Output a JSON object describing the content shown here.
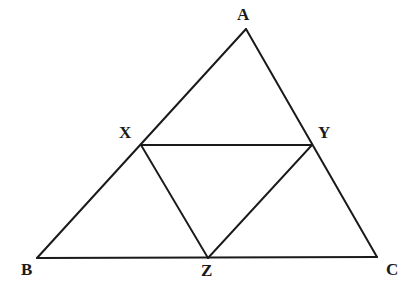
{
  "figure": {
    "canvas": {
      "width": 409,
      "height": 293
    },
    "background_color": "#ffffff",
    "stroke_color": "#1a1a1a",
    "outer_stroke_width": 2.0,
    "inner_stroke_width": 1.9,
    "points": {
      "A": {
        "label": "A",
        "x": 246,
        "y": 29,
        "label_x": 237,
        "label_y": 6
      },
      "B": {
        "label": "B",
        "x": 37,
        "y": 258,
        "label_x": 21,
        "label_y": 261
      },
      "C": {
        "label": "C",
        "x": 377,
        "y": 257,
        "label_x": 386,
        "label_y": 261
      },
      "X": {
        "label": "X",
        "x": 141,
        "y": 145,
        "label_x": 119,
        "label_y": 124
      },
      "Y": {
        "label": "Y",
        "x": 312,
        "y": 145,
        "label_x": 318,
        "label_y": 124
      },
      "Z": {
        "label": "Z",
        "x": 208,
        "y": 258,
        "label_x": 201,
        "label_y": 262
      }
    },
    "segments": [
      {
        "name": "side-AB",
        "from": "A",
        "to": "B",
        "kind": "outer"
      },
      {
        "name": "side-AC",
        "from": "A",
        "to": "C",
        "kind": "outer"
      },
      {
        "name": "side-BC",
        "from": "B",
        "to": "C",
        "kind": "outer"
      },
      {
        "name": "segment-XY",
        "from": "X",
        "to": "Y",
        "kind": "inner"
      },
      {
        "name": "segment-XZ",
        "from": "X",
        "to": "Z",
        "kind": "inner"
      },
      {
        "name": "segment-YZ",
        "from": "Y",
        "to": "Z",
        "kind": "inner"
      }
    ]
  },
  "chart_data": {
    "type": "diagram",
    "shape": "triangle",
    "vertices": [
      {
        "id": "A",
        "x": 246,
        "y": 29
      },
      {
        "id": "B",
        "x": 37,
        "y": 258
      },
      {
        "id": "C",
        "x": 377,
        "y": 257
      }
    ],
    "midpoints": [
      {
        "id": "X",
        "x": 141,
        "y": 145,
        "on_side": "AB"
      },
      {
        "id": "Y",
        "x": 312,
        "y": 145,
        "on_side": "AC"
      },
      {
        "id": "Z",
        "x": 208,
        "y": 258,
        "on_side": "BC"
      }
    ],
    "edges": [
      "AB",
      "AC",
      "BC",
      "XY",
      "XZ",
      "YZ"
    ],
    "labels": [
      "A",
      "B",
      "C",
      "X",
      "Y",
      "Z"
    ],
    "grid": false,
    "legend": "none"
  }
}
